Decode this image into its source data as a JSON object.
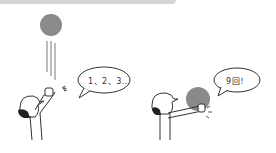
{
  "panels": [
    {
      "id": "toss",
      "speech": "1、2、3…",
      "ball_color": "#8a8a8a"
    },
    {
      "id": "catch",
      "speech": "9回！",
      "ball_color": "#8a8a8a"
    }
  ],
  "colors": {
    "line": "#333333",
    "ball": "#8a8a8a",
    "band": "#d4d4d4",
    "hair": "#222222"
  }
}
